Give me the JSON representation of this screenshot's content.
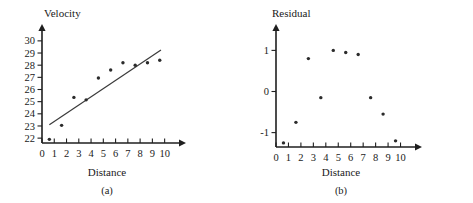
{
  "figure": {
    "background": "#ffffff",
    "ink": "#1a1a1a"
  },
  "panel_a": {
    "caption": "(a)",
    "ylabel": "Velocity",
    "xlabel": "Distance"
  },
  "panel_b": {
    "caption": "(b)",
    "ylabel": "Residual",
    "xlabel": "Distance"
  },
  "chart_data": [
    {
      "type": "scatter",
      "title": "",
      "panel": "(a)",
      "xlabel": "Distance",
      "ylabel": "Velocity",
      "xlim": [
        0,
        10.6
      ],
      "ylim": [
        21.6,
        30.4
      ],
      "xticks": [
        0,
        1,
        2,
        3,
        4,
        5,
        6,
        7,
        8,
        9,
        10
      ],
      "yticks": [
        22,
        23,
        24,
        25,
        26,
        27,
        28,
        29,
        30
      ],
      "xticklabels": [
        "0",
        "1",
        "2",
        "3",
        "4",
        "5",
        "6",
        "7",
        "8",
        "9",
        "10"
      ],
      "yticklabels": [
        "22",
        "23",
        "24",
        "25",
        "26",
        "27",
        "28",
        "29",
        "30"
      ],
      "grid": false,
      "legend": false,
      "x": [
        0.6,
        1.6,
        2.6,
        3.6,
        4.6,
        5.6,
        6.6,
        7.6,
        8.6,
        9.6
      ],
      "y": [
        21.9,
        23.05,
        25.35,
        25.15,
        26.95,
        27.6,
        28.2,
        28.0,
        28.2,
        28.4
      ],
      "fit_line": {
        "label": "least-squares line",
        "x": [
          0.6,
          9.7
        ],
        "y": [
          23.1,
          29.25
        ]
      }
    },
    {
      "type": "scatter",
      "title": "",
      "panel": "(b)",
      "xlabel": "Distance",
      "ylabel": "Residual",
      "xlim": [
        0,
        10.6
      ],
      "ylim": [
        -1.35,
        1.35
      ],
      "xticks": [
        0,
        1,
        2,
        3,
        4,
        5,
        6,
        7,
        8,
        9,
        10
      ],
      "yticks": [
        -1,
        0,
        1
      ],
      "xticklabels": [
        "0",
        "1",
        "2",
        "3",
        "4",
        "5",
        "6",
        "7",
        "8",
        "9",
        "10"
      ],
      "yticklabels": [
        "-1",
        "0",
        "1"
      ],
      "grid": false,
      "legend": false,
      "x": [
        0.6,
        1.6,
        2.6,
        3.6,
        4.6,
        5.6,
        6.6,
        7.6,
        8.6,
        9.6
      ],
      "y": [
        -1.25,
        -0.75,
        0.8,
        -0.15,
        1.0,
        0.95,
        0.9,
        -0.15,
        -0.55,
        -1.2
      ]
    }
  ]
}
